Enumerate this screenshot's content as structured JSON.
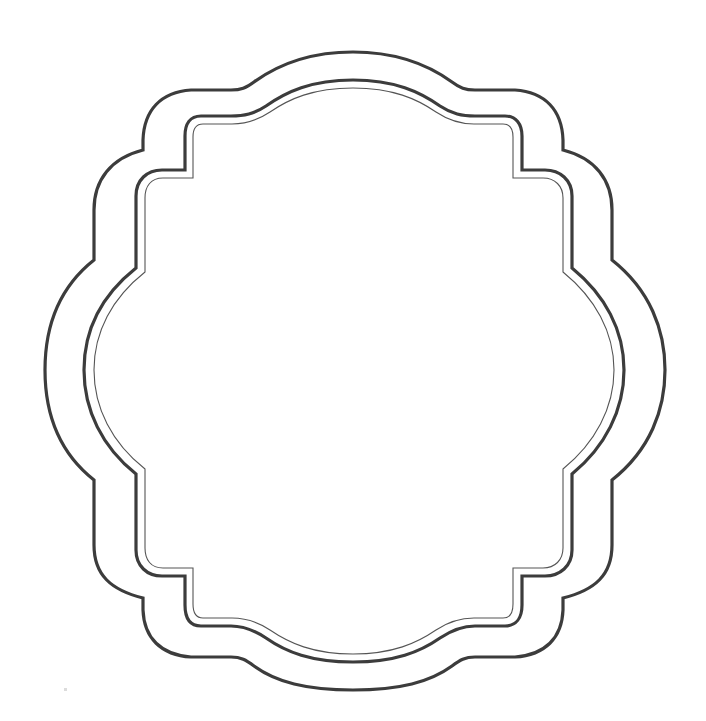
{
  "figure": {
    "caption": "",
    "background_color": "#ffffff",
    "stroke_color": "#3c3c3c",
    "layers": [
      {
        "name": "outer-border",
        "stroke_width": 3
      },
      {
        "name": "inner-border",
        "stroke_width": 3
      },
      {
        "name": "inner-thin-border",
        "stroke_width": 1
      }
    ]
  }
}
